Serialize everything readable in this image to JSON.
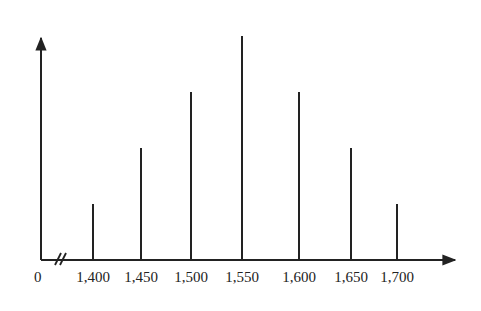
{
  "chart_data": {
    "type": "bar",
    "title": "",
    "xlabel": "",
    "ylabel": "",
    "origin_label": "0",
    "axis_break": true,
    "categories": [
      "1,400",
      "1,450",
      "1,500",
      "1,550",
      "1,600",
      "1,650",
      "1,700"
    ],
    "x": [
      1400,
      1450,
      1500,
      1550,
      1600,
      1650,
      1700
    ],
    "values": [
      1,
      2,
      3,
      4,
      3,
      2,
      1
    ],
    "y_ticks": [],
    "grid": false,
    "legend": null,
    "style": "vertical line bars (stem)"
  },
  "colors": {
    "line": "#222222",
    "background": "#ffffff"
  }
}
